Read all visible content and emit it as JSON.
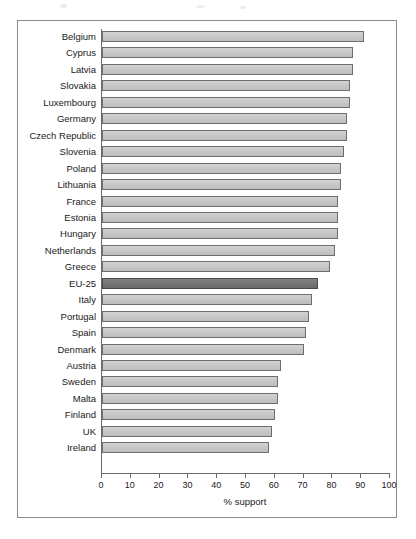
{
  "chart_data": {
    "type": "bar",
    "orientation": "horizontal",
    "title": "",
    "xlabel": "% support",
    "ylabel": "",
    "xlim": [
      0,
      100
    ],
    "xticks": [
      0,
      10,
      20,
      30,
      40,
      50,
      60,
      70,
      80,
      90,
      100
    ],
    "xtick_labels": [
      "0",
      "10",
      "20",
      "30",
      "40",
      "50",
      "60",
      "70",
      "80",
      "90",
      "100"
    ],
    "grid": false,
    "legend": false,
    "categories": [
      "Belgium",
      "Cyprus",
      "Latvia",
      "Slovakia",
      "Luxembourg",
      "Germany",
      "Czech Republic",
      "Slovenia",
      "Poland",
      "Lithuania",
      "France",
      "Estonia",
      "Hungary",
      "Netherlands",
      "Greece",
      "EU-25",
      "Italy",
      "Portugal",
      "Spain",
      "Denmark",
      "Austria",
      "Sweden",
      "Malta",
      "Finland",
      "UK",
      "Ireland"
    ],
    "values": [
      91,
      87,
      87,
      86,
      86,
      85,
      85,
      84,
      83,
      83,
      82,
      82,
      82,
      81,
      79,
      75,
      73,
      72,
      71,
      70,
      62,
      61,
      61,
      60,
      59,
      58
    ],
    "highlight_category": "EU-25",
    "bar_color": "#c8c8c8",
    "bar_edge_color": "#6e6e6e",
    "highlight_color": "#757575"
  }
}
